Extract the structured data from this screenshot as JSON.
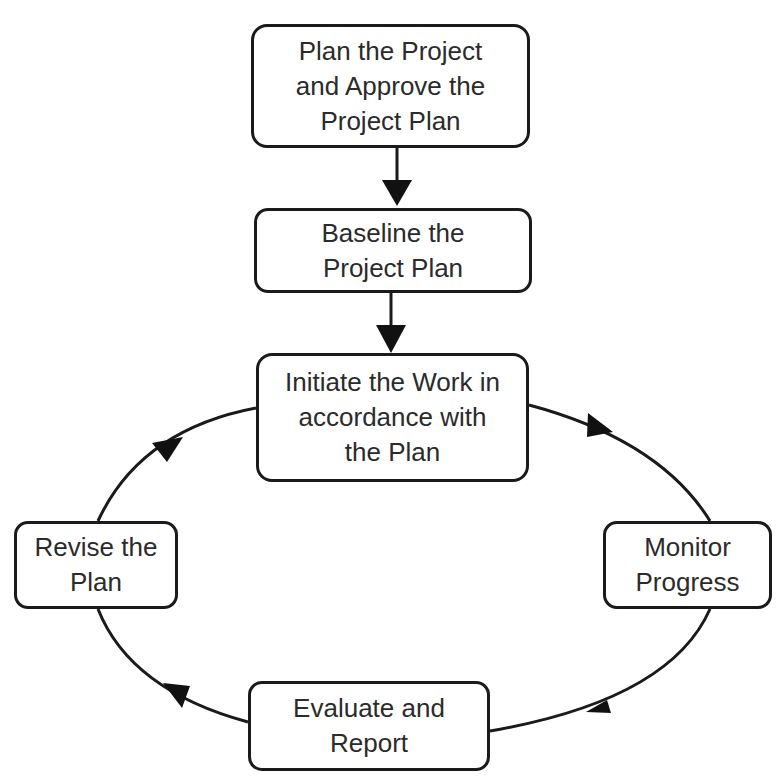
{
  "diagram": {
    "type": "flowchart-cycle",
    "colors": {
      "stroke": "#1a1a1a",
      "text": "#2b2b2b",
      "background": "#ffffff"
    },
    "nodes": [
      {
        "id": "plan",
        "label": "Plan the Project\nand Approve the\nProject Plan"
      },
      {
        "id": "baseline",
        "label": "Baseline  the\nProject Plan"
      },
      {
        "id": "initiate",
        "label": "Initiate the Work in\naccordance with\nthe Plan"
      },
      {
        "id": "monitor",
        "label": "Monitor\nProgress"
      },
      {
        "id": "evaluate",
        "label": "Evaluate and\nReport"
      },
      {
        "id": "revise",
        "label": "Revise the\nPlan"
      }
    ],
    "edges": [
      {
        "from": "plan",
        "to": "baseline"
      },
      {
        "from": "baseline",
        "to": "initiate"
      },
      {
        "from": "initiate",
        "to": "monitor"
      },
      {
        "from": "monitor",
        "to": "evaluate"
      },
      {
        "from": "evaluate",
        "to": "revise"
      },
      {
        "from": "revise",
        "to": "initiate"
      }
    ]
  }
}
